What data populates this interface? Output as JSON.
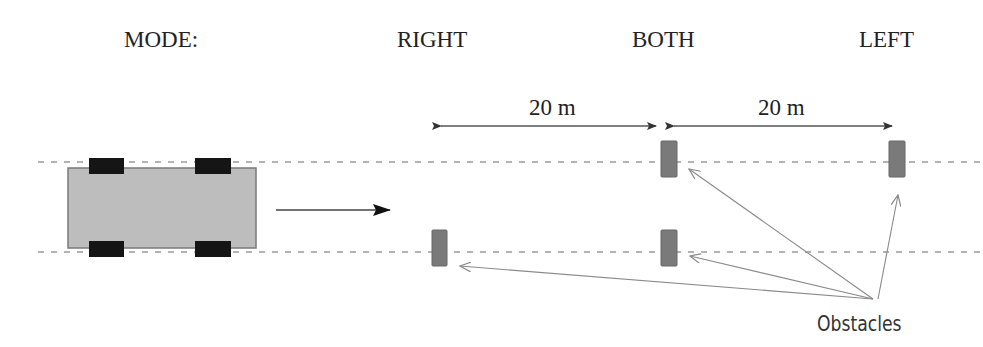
{
  "header": {
    "mode_label": "MODE:",
    "modes": [
      "RIGHT",
      "BOTH",
      "LEFT"
    ]
  },
  "dimensions": [
    {
      "label": "20 m",
      "from": "RIGHT obstacle",
      "to": "BOTH obstacles"
    },
    {
      "label": "20 m",
      "from": "BOTH obstacles",
      "to": "LEFT obstacle"
    }
  ],
  "annotation": {
    "obstacles_label": "Obstacles"
  },
  "colors": {
    "car_body": "#bdbdbd",
    "wheel": "#151515",
    "obstacle": "#7a7a7a",
    "lane_line": "#9a9a9a",
    "arrow": "#444444",
    "pointer": "#8a8a8a",
    "text": "#222222"
  },
  "scene": {
    "lanes": 2,
    "vehicle": {
      "wheels": 4,
      "direction": "right"
    },
    "obstacles": [
      {
        "mode": "RIGHT",
        "lane": "bottom"
      },
      {
        "mode": "BOTH",
        "lane": "top"
      },
      {
        "mode": "BOTH",
        "lane": "bottom"
      },
      {
        "mode": "LEFT",
        "lane": "top"
      }
    ]
  }
}
